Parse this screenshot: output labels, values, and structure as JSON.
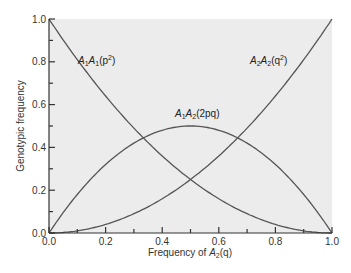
{
  "chart_data": {
    "type": "line",
    "title": "",
    "xlabel": "Frequency of A2(q)",
    "xlabel_parts": {
      "pre": "Frequency of ",
      "allele": "A",
      "sub": "2",
      "post": "(q)"
    },
    "ylabel": "Genotypic frequency",
    "xlim": [
      0,
      1
    ],
    "ylim": [
      0,
      1
    ],
    "grid": false,
    "x_ticks": [
      "0.0",
      "0.2",
      "0.4",
      "0.6",
      "0.8",
      "1.0"
    ],
    "y_ticks": [
      "0.0",
      "0.2",
      "0.4",
      "0.6",
      "0.8",
      "1.0"
    ],
    "x": [
      0.0,
      0.1,
      0.2,
      0.3,
      0.4,
      0.5,
      0.6,
      0.7,
      0.8,
      0.9,
      1.0
    ],
    "series": [
      {
        "name": "A1A1(p2)",
        "label_main": "A1A1",
        "formula": "p",
        "values": [
          1.0,
          0.81,
          0.64,
          0.49,
          0.36,
          0.25,
          0.16,
          0.09,
          0.04,
          0.01,
          0.0
        ]
      },
      {
        "name": "A1A2(2pq)",
        "label_main": "A1A2",
        "formula": "2pq",
        "values": [
          0.0,
          0.18,
          0.32,
          0.42,
          0.48,
          0.5,
          0.48,
          0.42,
          0.32,
          0.18,
          0.0
        ]
      },
      {
        "name": "A2A2(q2)",
        "label_main": "A2A2",
        "formula": "q",
        "values": [
          0.0,
          0.01,
          0.04,
          0.09,
          0.16,
          0.25,
          0.36,
          0.49,
          0.64,
          0.81,
          1.0
        ]
      }
    ],
    "colors": {
      "plot_bg": "#ececec",
      "curve": "#555555",
      "axis": "#333333"
    }
  }
}
